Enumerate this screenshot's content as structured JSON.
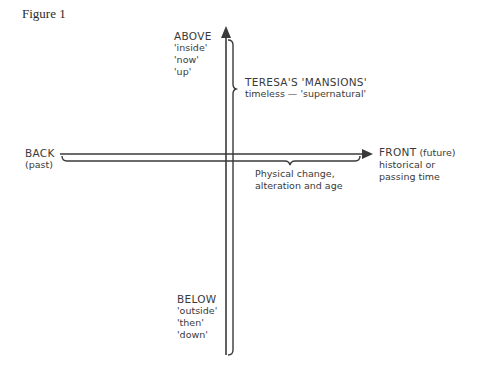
{
  "figure": {
    "title": "Figure 1"
  },
  "above": {
    "heading": "ABOVE",
    "lines": [
      "'inside'",
      "'now'",
      "'up'"
    ]
  },
  "below": {
    "heading": "BELOW",
    "lines": [
      "'outside'",
      "'then'",
      "'down'"
    ]
  },
  "back": {
    "heading": "BACK",
    "sub": "(past)"
  },
  "front": {
    "heading": "FRONT",
    "heading_suffix": "(future)",
    "lines": [
      "historical or",
      "passing time"
    ]
  },
  "vertical_brace_label": {
    "title": "TERESA'S 'MANSIONS'",
    "sub": "timeless — 'supernatural'"
  },
  "horizontal_brace_label": {
    "lines": [
      "Physical change,",
      "alteration and age"
    ]
  },
  "colors": {
    "line": "#3a3a3a",
    "text": "#3a3a3a",
    "background": "#ffffff"
  }
}
